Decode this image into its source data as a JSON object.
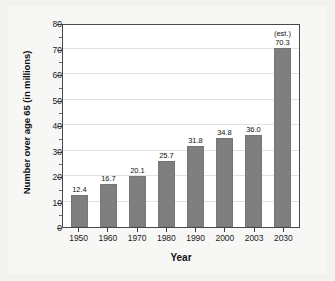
{
  "chart_data": {
    "type": "bar",
    "title": "",
    "xlabel": "Year",
    "ylabel": "Number over age 65 (in millions)",
    "categories": [
      "1950",
      "1960",
      "1970",
      "1980",
      "1990",
      "2000",
      "2003",
      "2030"
    ],
    "values": [
      12.4,
      16.7,
      20.1,
      25.7,
      31.8,
      34.8,
      36.0,
      70.3
    ],
    "value_labels": [
      "12.4",
      "16.7",
      "20.1",
      "25.7",
      "31.8",
      "34.8",
      "36.0",
      "70.3"
    ],
    "annotations": [
      {
        "category": "2030",
        "text": "(est.)"
      }
    ],
    "ylim": [
      0,
      80
    ],
    "yticks": [
      0,
      10,
      20,
      30,
      40,
      50,
      60,
      70,
      80
    ],
    "ytick_labels": [
      "0",
      "10",
      "20",
      "30",
      "40",
      "50",
      "60",
      "70",
      "80"
    ],
    "ytick_minor_step": 5,
    "grid": true,
    "grid_axis": "y",
    "legend": "none",
    "bar_color": "#7f7f7f",
    "plot_background": "#ffffff",
    "figure_background": "#f7f7f5"
  }
}
